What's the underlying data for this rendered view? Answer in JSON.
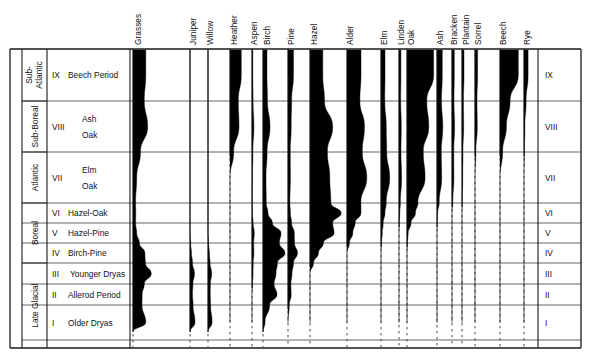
{
  "figure": {
    "kind": "pollen-diagram",
    "title": "",
    "colors": {
      "curve_fill": "#000000",
      "frame": "#1a1a1a",
      "grid": "#555555",
      "dashed": "#333333"
    }
  },
  "taxa_headers": [
    {
      "name": "Grasses",
      "x": 141
    },
    {
      "name": "Juniper",
      "x": 196
    },
    {
      "name": "Willow",
      "x": 213
    },
    {
      "name": "Heather",
      "x": 237
    },
    {
      "name": "Aspen",
      "x": 257
    },
    {
      "name": "Birch",
      "x": 270
    },
    {
      "name": "Pine",
      "x": 294
    },
    {
      "name": "Hazel",
      "x": 317
    },
    {
      "name": "Alder",
      "x": 353
    },
    {
      "name": "Elm",
      "x": 387
    },
    {
      "name": "Linden",
      "x": 404
    },
    {
      "name": "Oak",
      "x": 414
    },
    {
      "name": "Ash",
      "x": 443
    },
    {
      "name": "Bracken",
      "x": 457
    },
    {
      "name": "Plantain",
      "x": 469
    },
    {
      "name": "Sorrel",
      "x": 481
    },
    {
      "name": "Beech",
      "x": 506
    },
    {
      "name": "Rye",
      "x": 530
    }
  ],
  "periods": [
    {
      "label": "Sub-Atlantic",
      "top": 49,
      "bottom": 101
    },
    {
      "label": "Sub-Boreal",
      "top": 101,
      "bottom": 152
    },
    {
      "label": "Atlantic",
      "top": 152,
      "bottom": 203
    },
    {
      "label": "Boreal",
      "top": 203,
      "bottom": 263
    },
    {
      "label": "Late Glacial",
      "top": 263,
      "bottom": 348
    }
  ],
  "zones": [
    {
      "numeral": "IX",
      "name": "Beech Period",
      "name2": "",
      "top": 49,
      "bottom": 101
    },
    {
      "numeral": "VIII",
      "name": "Ash",
      "name2": "Oak",
      "top": 101,
      "bottom": 152
    },
    {
      "numeral": "VII",
      "name": "Elm",
      "name2": "Oak",
      "top": 152,
      "bottom": 203
    },
    {
      "numeral": "VI",
      "name": "Hazel-Oak",
      "name2": "",
      "top": 203,
      "bottom": 223
    },
    {
      "numeral": "V",
      "name": "Hazel-Pine",
      "name2": "",
      "top": 223,
      "bottom": 243
    },
    {
      "numeral": "IV",
      "name": "Birch-Pine",
      "name2": "",
      "top": 243,
      "bottom": 263
    },
    {
      "numeral": "III",
      "name": "Younger Dryas",
      "name2": "",
      "top": 263,
      "bottom": 284
    },
    {
      "numeral": "II",
      "name": "Allerod Period",
      "name2": "",
      "top": 284,
      "bottom": 305
    },
    {
      "numeral": "I",
      "name": "Older Dryas",
      "name2": "",
      "top": 305,
      "bottom": 340
    }
  ],
  "chart_data": {
    "type": "area",
    "orientation": "vertical-stratigraphic",
    "xlabel": "Pollen taxa (relative abundance, silhouette widths)",
    "ylabel": "Pollen zones / climatic periods",
    "depth_axis_top": "recent (IX Beech Period)",
    "depth_axis_bottom": "oldest (I Older Dryas)",
    "grid": true,
    "legend": "none",
    "categories": [
      "IX",
      "VIII",
      "VII",
      "VI",
      "V",
      "IV",
      "III",
      "II",
      "I"
    ],
    "series": [
      {
        "name": "Grasses",
        "baseline_x": 133,
        "max_width": 22,
        "values": [
          14,
          16,
          4,
          3,
          4,
          13,
          20,
          10,
          14
        ]
      },
      {
        "name": "Juniper",
        "baseline_x": 190,
        "max_width": 12,
        "values": [
          0,
          0,
          0,
          0,
          0,
          3,
          9,
          5,
          10
        ]
      },
      {
        "name": "Willow",
        "baseline_x": 208,
        "max_width": 11,
        "values": [
          0,
          0,
          0,
          0,
          0,
          3,
          8,
          5,
          9
        ]
      },
      {
        "name": "Heather",
        "baseline_x": 230,
        "max_width": 18,
        "values": [
          15,
          12,
          0,
          0,
          0,
          0,
          0,
          0,
          0
        ]
      },
      {
        "name": "Aspen",
        "baseline_x": 252,
        "max_width": 9,
        "values": [
          2,
          5,
          1,
          1,
          6,
          5,
          3,
          0,
          0
        ]
      },
      {
        "name": "Birch",
        "baseline_x": 263,
        "max_width": 24,
        "values": [
          4,
          7,
          3,
          5,
          18,
          22,
          13,
          14,
          2
        ]
      },
      {
        "name": "Pine",
        "baseline_x": 288,
        "max_width": 19,
        "values": [
          7,
          4,
          3,
          3,
          8,
          12,
          5,
          4,
          0
        ]
      },
      {
        "name": "Hazel",
        "baseline_x": 310,
        "max_width": 34,
        "values": [
          9,
          16,
          14,
          22,
          17,
          6,
          0,
          0,
          0
        ]
      },
      {
        "name": "Alder",
        "baseline_x": 347,
        "max_width": 28,
        "values": [
          12,
          15,
          17,
          12,
          5,
          0,
          0,
          0,
          0
        ]
      },
      {
        "name": "Elm",
        "baseline_x": 381,
        "max_width": 16,
        "values": [
          6,
          8,
          13,
          6,
          2,
          0,
          0,
          0,
          0
        ]
      },
      {
        "name": "Linden",
        "baseline_x": 399,
        "max_width": 9,
        "values": [
          5,
          6,
          7,
          2,
          0,
          0,
          0,
          0,
          0
        ]
      },
      {
        "name": "Oak",
        "baseline_x": 407,
        "max_width": 29,
        "values": [
          22,
          18,
          15,
          7,
          1,
          0,
          0,
          0,
          0
        ]
      },
      {
        "name": "Ash",
        "baseline_x": 437,
        "max_width": 14,
        "values": [
          9,
          10,
          8,
          1,
          0,
          0,
          0,
          0,
          0
        ]
      },
      {
        "name": "Bracken",
        "baseline_x": 452,
        "max_width": 9,
        "values": [
          6,
          7,
          5,
          0,
          0,
          0,
          0,
          0,
          0
        ]
      },
      {
        "name": "Plantain",
        "baseline_x": 462,
        "max_width": 8,
        "values": [
          6,
          5,
          2,
          0,
          0,
          0,
          0,
          0,
          0
        ]
      },
      {
        "name": "Sorrel",
        "baseline_x": 475,
        "max_width": 9,
        "values": [
          7,
          6,
          0,
          0,
          0,
          0,
          0,
          0,
          0
        ]
      },
      {
        "name": "Beech",
        "baseline_x": 500,
        "max_width": 22,
        "values": [
          20,
          7,
          0,
          0,
          0,
          0,
          0,
          0,
          0
        ]
      },
      {
        "name": "Rye",
        "baseline_x": 524,
        "max_width": 11,
        "values": [
          9,
          2,
          0,
          0,
          0,
          0,
          0,
          0,
          0
        ]
      }
    ]
  }
}
